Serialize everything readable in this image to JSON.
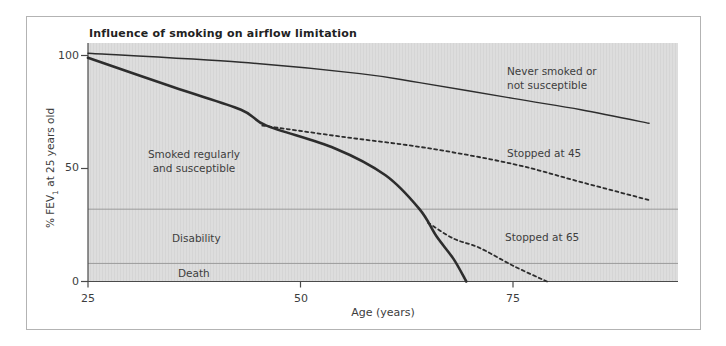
{
  "colors": {
    "line": "#2d2d2d",
    "axis": "#4a4a4a",
    "reference_line": "#9b9b9b",
    "plot_background": "#dcdcdc",
    "frame_border": "#b3b3b3",
    "text": "#3d3d3d"
  },
  "y_axis_label": {
    "prefix": "% FEV",
    "sub": "1",
    "suffix": " at 25 years old"
  },
  "curve_labels": {
    "never": {
      "line1": "Never smoked or",
      "line2": "not susceptible"
    },
    "smoked": {
      "line1": "Smoked regularly",
      "line2": "and susceptible"
    }
  },
  "chart_data": {
    "type": "line",
    "title": "Influence of smoking on airflow limitation",
    "xlabel": "Age (years)",
    "ylabel": "% FEV1 at 25 years old",
    "xlim": [
      25,
      95
    ],
    "ylim": [
      0,
      105
    ],
    "x_ticks": [
      25,
      50,
      75
    ],
    "y_ticks": [
      0,
      50,
      100
    ],
    "grid": false,
    "legend": "inline-labels",
    "series": [
      {
        "name": "Never smoked or not susceptible",
        "style": "solid-thin",
        "points": [
          [
            25,
            101
          ],
          [
            43,
            97
          ],
          [
            57,
            92
          ],
          [
            64,
            88
          ],
          [
            75,
            81
          ],
          [
            83,
            76
          ],
          [
            91,
            70
          ]
        ]
      },
      {
        "name": "Smoked regularly and susceptible",
        "style": "solid-thick",
        "points": [
          [
            25,
            99
          ],
          [
            35,
            86
          ],
          [
            43,
            76
          ],
          [
            46,
            69
          ],
          [
            54,
            59
          ],
          [
            60,
            47
          ],
          [
            64,
            32
          ],
          [
            66,
            20
          ],
          [
            68,
            10
          ],
          [
            69.5,
            0
          ]
        ]
      },
      {
        "name": "Stopped at 45",
        "style": "dashed",
        "points": [
          [
            45.5,
            69
          ],
          [
            55,
            64
          ],
          [
            65,
            59
          ],
          [
            75,
            52
          ],
          [
            83,
            44
          ],
          [
            91,
            36
          ]
        ]
      },
      {
        "name": "Stopped at 65",
        "style": "dashed",
        "points": [
          [
            65,
            26
          ],
          [
            68,
            19
          ],
          [
            71,
            15
          ],
          [
            75,
            7
          ],
          [
            79,
            0
          ]
        ]
      }
    ],
    "reference_lines": [
      {
        "label": "Disability",
        "value": 32
      },
      {
        "label": "Death",
        "value": 8
      }
    ]
  }
}
